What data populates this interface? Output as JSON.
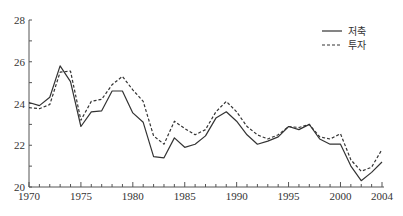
{
  "chart_data": {
    "type": "line",
    "title": "",
    "xlabel": "",
    "ylabel": "",
    "xlim": [
      1970,
      2004
    ],
    "ylim": [
      20,
      28
    ],
    "grid": false,
    "legend_position": "top-right",
    "x_ticks": [
      "1970",
      "1975",
      "1980",
      "1985",
      "1990",
      "1995",
      "2000",
      "2004"
    ],
    "y_ticks": [
      "20",
      "22",
      "24",
      "26",
      "28"
    ],
    "x": [
      1970,
      1971,
      1972,
      1973,
      1974,
      1975,
      1976,
      1977,
      1978,
      1979,
      1980,
      1981,
      1982,
      1983,
      1984,
      1985,
      1986,
      1987,
      1988,
      1989,
      1990,
      1991,
      1992,
      1993,
      1994,
      1995,
      1996,
      1997,
      1998,
      1999,
      2000,
      2001,
      2002,
      2003,
      2004
    ],
    "series": [
      {
        "name": "저축",
        "style": "solid",
        "values": [
          24.05,
          23.9,
          24.3,
          25.8,
          25.05,
          22.9,
          23.6,
          23.65,
          24.6,
          24.6,
          23.55,
          23.1,
          21.45,
          21.4,
          22.35,
          21.9,
          22.05,
          22.45,
          23.3,
          23.6,
          23.15,
          22.5,
          22.05,
          22.2,
          22.4,
          22.9,
          22.75,
          23.0,
          22.3,
          22.05,
          22.05,
          21.0,
          20.3,
          20.7,
          21.2
        ]
      },
      {
        "name": "투자",
        "style": "dashed",
        "values": [
          23.8,
          23.75,
          23.95,
          25.5,
          25.55,
          23.2,
          24.1,
          24.2,
          24.9,
          25.3,
          24.65,
          24.1,
          22.45,
          22.05,
          23.15,
          22.8,
          22.5,
          22.75,
          23.6,
          24.1,
          23.6,
          22.9,
          22.5,
          22.3,
          22.5,
          22.9,
          22.85,
          23.0,
          22.4,
          22.3,
          22.55,
          21.3,
          20.75,
          20.95,
          21.8
        ]
      }
    ]
  },
  "legend": {
    "items": [
      {
        "label": "저축",
        "style": "solid"
      },
      {
        "label": "투자",
        "style": "dashed"
      }
    ]
  },
  "colors": {
    "line": "#333333",
    "axis": "#555555"
  }
}
